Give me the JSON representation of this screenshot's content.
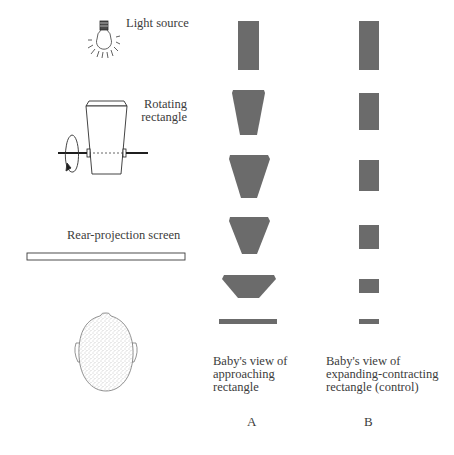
{
  "labels": {
    "light_source": "Light source",
    "rotating_line1": "Rotating",
    "rotating_line2": "rectangle",
    "screen": "Rear-projection screen"
  },
  "columns": {
    "A": {
      "letter": "A",
      "caption_lines": [
        "Baby's view of",
        "approaching",
        "rectangle"
      ]
    },
    "B": {
      "letter": "B",
      "caption_lines": [
        "Baby's view of",
        "expanding-contracting",
        "rectangle (control)"
      ]
    }
  },
  "icons": {
    "light_bulb": "light-bulb-icon",
    "rotating_rectangle": "rotating-rectangle-icon",
    "rotation_arrow": "rotation-arrow-icon",
    "screen": "projection-screen-icon",
    "baby_head": "baby-head-icon"
  },
  "colors": {
    "shape_fill": "#6b6b6b",
    "line": "#3a3a3a",
    "background": "#ffffff"
  },
  "sequence_count": 6
}
